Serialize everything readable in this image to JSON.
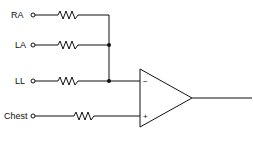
{
  "diagram": {
    "inputs": [
      {
        "label": "RA",
        "y": 15
      },
      {
        "label": "LA",
        "y": 45
      },
      {
        "label": "LL",
        "y": 81
      },
      {
        "label": "Chest",
        "y": 116
      }
    ],
    "opamp": {
      "inverting_symbol": "−",
      "noninverting_symbol": "+"
    },
    "colors": {
      "line": "#111111",
      "background": "#ffffff"
    }
  }
}
